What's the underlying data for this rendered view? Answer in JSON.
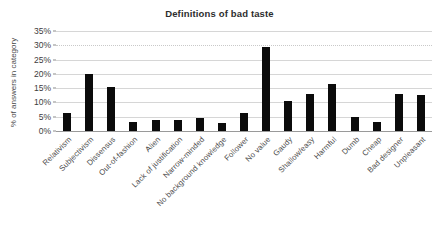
{
  "chart_data": {
    "type": "bar",
    "title": "Definitions of bad taste",
    "xlabel": "",
    "ylabel": "% of answers in category",
    "ylim": [
      0,
      35
    ],
    "ytick_labels": [
      "0%",
      "5%",
      "10%",
      "15%",
      "20%",
      "25%",
      "30%",
      "35%"
    ],
    "ytick_values": [
      0,
      5,
      10,
      15,
      20,
      25,
      30,
      35
    ],
    "grid": true,
    "legend": false,
    "bar_color": "#0b0b0b",
    "categories": [
      "Relativism",
      "Subjectivism",
      "Dissensus",
      "Out-of-fashion",
      "Alien",
      "Lack of justification",
      "Narrow-minded",
      "No background knowledge",
      "Follower",
      "No value",
      "Gaudy",
      "Shallow/easy",
      "Harmful",
      "Dumb",
      "Cheap",
      "Bad designer",
      "Unpleasant"
    ],
    "values": [
      6.2,
      20.1,
      15.3,
      3.0,
      4.0,
      4.0,
      4.4,
      2.7,
      6.3,
      29.5,
      10.5,
      12.9,
      16.4,
      4.9,
      3.1,
      13.1,
      12.7
    ]
  }
}
